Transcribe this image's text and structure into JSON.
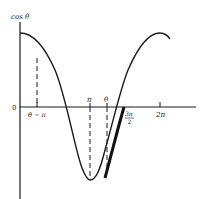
{
  "diagram": {
    "type": "function-plot",
    "function": "cos θ",
    "y_axis_label": "cos θ",
    "origin_label": "0",
    "x_ticks": [
      {
        "label": "θ − π",
        "value": "theta-pi",
        "x": 37
      },
      {
        "label": "π",
        "value": "pi",
        "x": 90
      },
      {
        "label": "θ",
        "value": "theta",
        "x": 107
      },
      {
        "label": "3π",
        "label_den": "2",
        "value": "3pi/2",
        "x": 124
      },
      {
        "label": "2π",
        "value": "2pi",
        "x": 160
      }
    ],
    "dashed_guides": [
      "θ − π",
      "π",
      "θ"
    ],
    "highlighted_segment": {
      "from": "θ",
      "to": "3π/2",
      "style": "bold"
    },
    "colors": {
      "ink": "#1a1a1a",
      "background": "#ffffff"
    }
  }
}
